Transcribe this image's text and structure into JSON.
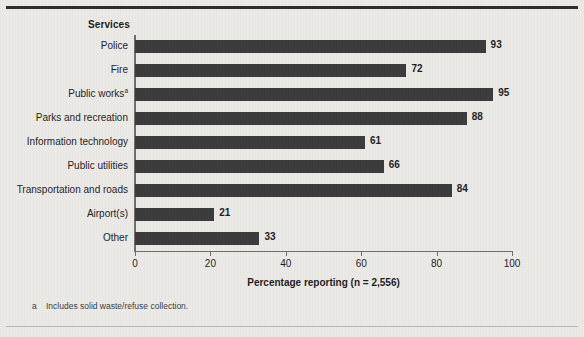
{
  "figure": {
    "services_header": "Services",
    "x_axis_title": "Percentage reporting (n = 2,556)",
    "footnote_marker": "a",
    "footnote_text": "Includes solid waste/refuse collection.",
    "bar_color": "#3a3a3a",
    "background_color": "#eceae7",
    "axis_color": "#6e6b68",
    "rule_color": "#2b2b2b"
  },
  "chart_data": {
    "type": "bar",
    "orientation": "horizontal",
    "title": "",
    "subtitle": "",
    "xlabel": "Percentage reporting (n = 2,556)",
    "ylabel": "Services",
    "categories": [
      "Police",
      "Fire",
      "Public works",
      "Parks and recreation",
      "Information technology",
      "Public utilities",
      "Transportation and roads",
      "Airport(s)",
      "Other"
    ],
    "category_footnote_markers": [
      "",
      "",
      "a",
      "",
      "",
      "",
      "",
      "",
      ""
    ],
    "values": [
      93,
      72,
      95,
      88,
      61,
      66,
      84,
      21,
      33
    ],
    "value_labels": [
      "93",
      "72",
      "95",
      "88",
      "61",
      "66",
      "84",
      "21",
      "33"
    ],
    "xlim": [
      0,
      100
    ],
    "xticks": [
      0,
      20,
      40,
      60,
      80,
      100
    ],
    "xtick_labels": [
      "0",
      "20",
      "40",
      "60",
      "80",
      "100"
    ],
    "grid": false,
    "legend": null,
    "annotations": [
      "a  Includes solid waste/refuse collection."
    ]
  }
}
